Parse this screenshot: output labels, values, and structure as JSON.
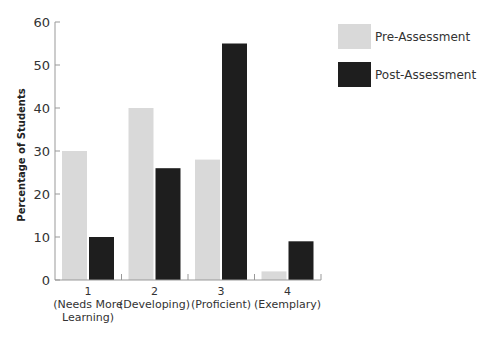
{
  "chart_data": {
    "type": "bar",
    "title": "",
    "xlabel": "",
    "ylabel": "Percentage of Students",
    "ylim": [
      0,
      60
    ],
    "yticks": [
      0,
      10,
      20,
      30,
      40,
      50,
      60
    ],
    "grid": false,
    "legend_position": "top-right",
    "categories": [
      {
        "number": "1",
        "lines": [
          "(Needs More",
          "Learning)"
        ]
      },
      {
        "number": "2",
        "lines": [
          "(Developing)"
        ]
      },
      {
        "number": "3",
        "lines": [
          "(Proficient)"
        ]
      },
      {
        "number": "4",
        "lines": [
          "(Exemplary)"
        ]
      }
    ],
    "category_labels": [
      "1 (Needs More Learning)",
      "2 (Developing)",
      "3 (Proficient)",
      "4 (Exemplary)"
    ],
    "series": [
      {
        "name": "Pre-Assessment",
        "color": "#d9d9d9",
        "values": [
          30,
          40,
          28,
          2
        ]
      },
      {
        "name": "Post-Assessment",
        "color": "#1e1e1e",
        "values": [
          10,
          26,
          55,
          9
        ]
      }
    ]
  },
  "colors": {
    "axis": "#999999",
    "text": "#333333"
  }
}
